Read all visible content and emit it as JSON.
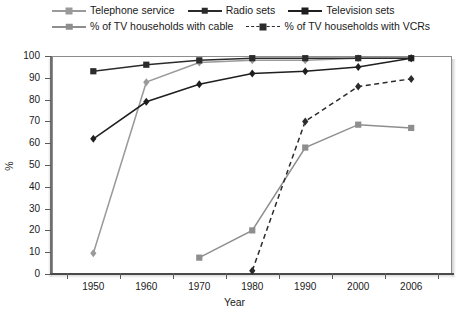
{
  "chart_data": {
    "type": "line",
    "title": "",
    "xlabel": "Year",
    "ylabel": "%",
    "categories": [
      "1950",
      "1960",
      "1970",
      "1980",
      "1990",
      "2000",
      "2006"
    ],
    "x": [
      1950,
      1960,
      1970,
      1980,
      1990,
      2000,
      2006
    ],
    "ylim": [
      0,
      100
    ],
    "yticks": [
      0,
      10,
      20,
      30,
      40,
      50,
      60,
      70,
      80,
      90,
      100
    ],
    "grid": false,
    "legend_position": "top",
    "series": [
      {
        "name": "Telephone service",
        "color": "#9a9a9a",
        "marker": "diamond",
        "dashed": false,
        "values": [
          9.5,
          88,
          97,
          98,
          98,
          99,
          99
        ]
      },
      {
        "name": "Radio sets",
        "color": "#2b2b2b",
        "marker": "square",
        "dashed": false,
        "values": [
          93,
          96,
          98,
          99,
          99,
          99,
          99
        ]
      },
      {
        "name": "Television sets",
        "color": "#1f1f1f",
        "marker": "diamond",
        "dashed": false,
        "values": [
          62,
          79,
          87,
          92,
          93,
          95,
          99
        ]
      },
      {
        "name": "% of TV households with cable",
        "color": "#8e8e8e",
        "marker": "square",
        "dashed": false,
        "values": [
          null,
          null,
          7.5,
          20,
          58,
          68.5,
          67
        ]
      },
      {
        "name": "% of TV households with VCRs",
        "color": "#2b2b2b",
        "marker": "diamond",
        "dashed": true,
        "values": [
          null,
          null,
          null,
          1.5,
          70,
          86,
          89.5
        ]
      }
    ]
  },
  "legend": {
    "items": [
      {
        "label": "Telephone service"
      },
      {
        "label": "Radio sets"
      },
      {
        "label": "Television sets"
      },
      {
        "label": "% of TV households with cable"
      },
      {
        "label": "% of TV households with VCRs"
      }
    ]
  },
  "axes": {
    "x_title": "Year",
    "y_title": "%"
  },
  "colors": {
    "gray_series": "#9a9a9a",
    "dark_series": "#2b2b2b",
    "axis": "#5a5a5a",
    "frame": "#8d8d8d",
    "background": "#ffffff"
  }
}
